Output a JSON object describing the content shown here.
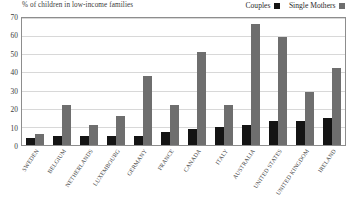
{
  "chart_data": {
    "type": "bar",
    "title": "% of children in low-income families",
    "xlabel": "",
    "ylabel": "",
    "ylim": [
      0,
      70
    ],
    "yticks": [
      0,
      10,
      20,
      30,
      40,
      50,
      60,
      70
    ],
    "grid": true,
    "legend_position": "top-right",
    "categories": [
      "SWEDEN",
      "BELGIUM",
      "NETHERLANDS",
      "LUXEMBOURG",
      "GERMANY",
      "FRANCE",
      "CANADA",
      "ITALY",
      "AUSTRALIA",
      "UNITED STATES",
      "UNITED KINGDOM",
      "IRELAND"
    ],
    "series": [
      {
        "name": "Couples",
        "color": "#141414",
        "values": [
          4,
          5,
          5,
          5,
          5,
          7,
          9,
          10,
          11,
          13,
          13,
          15
        ]
      },
      {
        "name": "Single Mothers",
        "color": "#6e6e6e",
        "values": [
          6,
          22,
          11,
          16,
          38,
          22,
          51,
          22,
          66,
          59,
          29,
          42
        ]
      }
    ]
  },
  "legend": {
    "entries": [
      {
        "label": "Couples",
        "color": "#141414"
      },
      {
        "label": "Single Mothers",
        "color": "#6e6e6e"
      }
    ]
  }
}
